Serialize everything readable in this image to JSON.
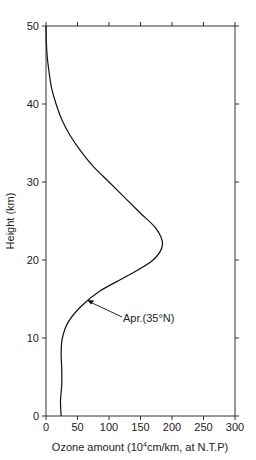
{
  "chart_data": {
    "type": "line",
    "title": "",
    "xlabel": "Ozone amount (10^4 cm/km, at N.T.P)",
    "xlabel_parts": {
      "pre": "Ozone amount (10",
      "sup": "4",
      "post": "cm/km, at N.T.P)"
    },
    "ylabel": "Height (km)",
    "xlim": [
      0,
      300
    ],
    "ylim": [
      0,
      50
    ],
    "xticks": [
      0,
      50,
      100,
      150,
      200,
      250,
      300
    ],
    "yticks": [
      0,
      10,
      20,
      30,
      40,
      50
    ],
    "grid": false,
    "series": [
      {
        "name": "Apr.(35°N)",
        "points": [
          [
            24,
            0
          ],
          [
            23,
            2
          ],
          [
            25,
            4
          ],
          [
            25,
            6
          ],
          [
            24,
            8
          ],
          [
            26,
            10
          ],
          [
            35,
            12
          ],
          [
            55,
            14
          ],
          [
            85,
            16
          ],
          [
            130,
            18
          ],
          [
            170,
            20
          ],
          [
            185,
            22
          ],
          [
            175,
            24
          ],
          [
            150,
            26
          ],
          [
            125,
            28
          ],
          [
            100,
            30
          ],
          [
            75,
            32
          ],
          [
            55,
            34
          ],
          [
            38,
            36
          ],
          [
            25,
            38
          ],
          [
            16,
            40
          ],
          [
            9,
            42
          ],
          [
            5,
            44
          ],
          [
            2,
            46
          ],
          [
            0.5,
            48
          ],
          [
            0,
            50
          ]
        ]
      }
    ],
    "annotations": [
      {
        "text": "Apr.(35°N)",
        "arrow_to": [
          62,
          15
        ],
        "text_at": [
          110,
          12
        ]
      }
    ]
  }
}
